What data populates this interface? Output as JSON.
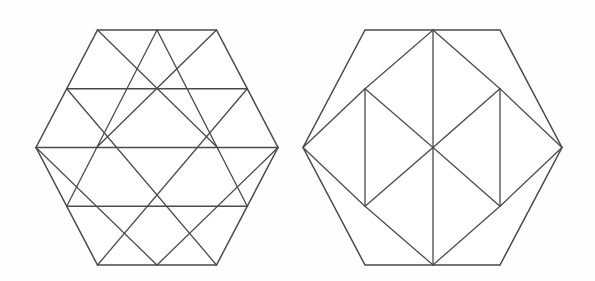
{
  "figure": {
    "background_color": "#fefefe",
    "stroke_color": "#4a4a4a",
    "fill_color": "#ffffff",
    "canvas": {
      "width": 595,
      "height": 281
    },
    "shapes": [
      {
        "id": "left-hexagon",
        "name": "triangular-lattice-hexagon",
        "description": "Regular flat-top hexagon subdivided into 24 congruent equilateral triangles",
        "center": {
          "x": 157,
          "y": 147.5
        },
        "circumradius": 121,
        "orientation": "flat-top",
        "vertices": [
          {
            "x": 97.5,
            "y": 30
          },
          {
            "x": 216.5,
            "y": 30
          },
          {
            "x": 278,
            "y": 147.5
          },
          {
            "x": 216.5,
            "y": 265
          },
          {
            "x": 97.5,
            "y": 265
          },
          {
            "x": 36,
            "y": 147.5
          }
        ],
        "subdivision_type": "triangles",
        "cell_count": 24,
        "row_y_values": [
          30,
          88.75,
          147.5,
          206.25,
          265
        ],
        "row_node_counts": [
          3,
          4,
          5,
          4,
          3
        ]
      },
      {
        "id": "right-hexagon",
        "name": "rhombus-rosette-hexagon",
        "description": "Regular flat-top hexagon with a central six-rhombus rosette surrounded by six outer cells",
        "center": {
          "x": 433,
          "y": 147.5
        },
        "circumradius": 130,
        "orientation": "flat-top",
        "vertices": [
          {
            "x": 365,
            "y": 30
          },
          {
            "x": 500,
            "y": 30
          },
          {
            "x": 562,
            "y": 147.5
          },
          {
            "x": 500,
            "y": 265
          },
          {
            "x": 365,
            "y": 265
          },
          {
            "x": 303,
            "y": 147.5
          }
        ],
        "subdivision_type": "rhombi",
        "inner_cell_count": 6,
        "outer_cell_count": 6,
        "inner_hexagon_vertices": [
          {
            "x": 433,
            "y": 30
          },
          {
            "x": 500,
            "y": 88.75
          },
          {
            "x": 500,
            "y": 206.25
          },
          {
            "x": 433,
            "y": 265
          },
          {
            "x": 365,
            "y": 206.25
          },
          {
            "x": 365,
            "y": 88.75
          }
        ],
        "rosette_spokes": [
          {
            "from": {
              "x": 433,
              "y": 147.5
            },
            "to": {
              "x": 433,
              "y": 30
            }
          },
          {
            "from": {
              "x": 433,
              "y": 147.5
            },
            "to": {
              "x": 500,
              "y": 88.75
            }
          },
          {
            "from": {
              "x": 433,
              "y": 147.5
            },
            "to": {
              "x": 500,
              "y": 206.25
            }
          },
          {
            "from": {
              "x": 433,
              "y": 147.5
            },
            "to": {
              "x": 433,
              "y": 265
            }
          },
          {
            "from": {
              "x": 433,
              "y": 147.5
            },
            "to": {
              "x": 365,
              "y": 206.25
            }
          },
          {
            "from": {
              "x": 433,
              "y": 147.5
            },
            "to": {
              "x": 365,
              "y": 88.75
            }
          }
        ]
      }
    ]
  },
  "chart_data": {
    "type": "diagram",
    "panels": [
      {
        "label": "left",
        "tiling": "equilateral triangles",
        "pieces": 24,
        "rows": [
          {
            "y": 30,
            "nodes_x": [
              97.5,
              157,
              216.5
            ]
          },
          {
            "y": 88.75,
            "nodes_x": [
              66.75,
              127.25,
              187.75,
              247.25
            ]
          },
          {
            "y": 147.5,
            "nodes_x": [
              36,
              96.5,
              157,
              217.5,
              278
            ]
          },
          {
            "y": 206.25,
            "nodes_x": [
              66.75,
              127.25,
              187.75,
              247.25
            ]
          },
          {
            "y": 265,
            "nodes_x": [
              97.5,
              157,
              216.5
            ]
          }
        ]
      },
      {
        "label": "right",
        "tiling": "rhombi plus outer cells",
        "pieces": 12,
        "inner_pieces": 6,
        "outer_pieces": 6
      }
    ]
  }
}
